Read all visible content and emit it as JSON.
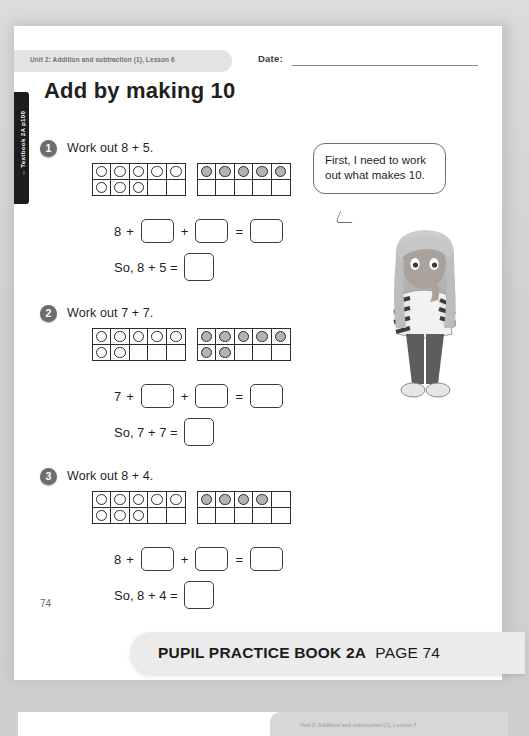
{
  "header": {
    "unit_text": "Unit 2: Addition and subtraction (1), Lesson 6",
    "date_label": "Date:",
    "side_tab": "→ Textbook 2A p100"
  },
  "title": "Add by making 10",
  "speech_bubble": {
    "text": "First, I need to work out what makes 10."
  },
  "questions": [
    {
      "number": "1",
      "prompt": "Work out 8 + 5.",
      "left_frame": {
        "fill_style": "white",
        "count": 8,
        "cells": [
          "dot",
          "dot",
          "dot",
          "dot",
          "dot",
          "dot",
          "dot",
          "dot",
          "empty",
          "empty"
        ]
      },
      "right_frame": {
        "fill_style": "grey",
        "count": 5,
        "cells": [
          "dot",
          "dot",
          "dot",
          "dot",
          "dot",
          "empty",
          "empty",
          "empty",
          "empty",
          "empty"
        ]
      },
      "equation_prefix": "8",
      "equation": "8 + □ + □ = □",
      "conclusion": "So, 8 + 5 =",
      "answer": ""
    },
    {
      "number": "2",
      "prompt": "Work out 7 + 7.",
      "left_frame": {
        "fill_style": "white",
        "count": 7,
        "cells": [
          "dot",
          "dot",
          "dot",
          "dot",
          "dot",
          "dot",
          "dot",
          "empty",
          "empty",
          "empty"
        ]
      },
      "right_frame": {
        "fill_style": "grey",
        "count": 7,
        "cells": [
          "dot",
          "dot",
          "dot",
          "dot",
          "dot",
          "dot",
          "dot",
          "empty",
          "empty",
          "empty"
        ]
      },
      "equation_prefix": "7",
      "equation": "7 + □ + □ = □",
      "conclusion": "So, 7 + 7 =",
      "answer": ""
    },
    {
      "number": "3",
      "prompt": "Work out 8 + 4.",
      "left_frame": {
        "fill_style": "white",
        "count": 8,
        "cells": [
          "dot",
          "dot",
          "dot",
          "dot",
          "dot",
          "dot",
          "dot",
          "dot",
          "empty",
          "empty"
        ]
      },
      "right_frame": {
        "fill_style": "grey",
        "count": 4,
        "cells": [
          "dot",
          "dot",
          "dot",
          "dot",
          "empty",
          "empty",
          "empty",
          "empty",
          "empty",
          "empty"
        ]
      },
      "equation_prefix": "8",
      "equation": "8 + □ + □ = □",
      "conclusion": "So, 8 + 4 =",
      "answer": ""
    }
  ],
  "operators": {
    "plus": "+",
    "equals": "="
  },
  "page_number": "74",
  "banner": {
    "book": "PUPIL PRACTICE BOOK 2A",
    "page": "PAGE 74"
  },
  "next_page": {
    "unit_text": "Unit 2: Addition and subtraction (1), Lesson 7"
  },
  "colors": {
    "paper": "#ffffff",
    "ink": "#1f1f1f",
    "counter_grey": "#b3b3b3",
    "tab_black": "#1d1d1d",
    "banner_grey": "#ebebeb"
  }
}
